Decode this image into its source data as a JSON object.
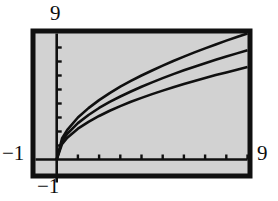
{
  "figure": {
    "kind": "mathematical-plot",
    "background_color": "#ffffff",
    "plot_background_color": "#d2d2d2",
    "frame_color": "#101010",
    "curve_color": "#101010"
  },
  "labels": {
    "top": "9",
    "left": "−1",
    "right": "9",
    "bottom": "−1"
  },
  "chart_data": {
    "type": "line",
    "title": "",
    "xlabel": "",
    "ylabel": "",
    "xlim": [
      -1,
      9
    ],
    "ylim": [
      -1,
      9
    ],
    "grid": false,
    "legend": "none",
    "axis_tick_labels": {
      "x": [
        "-1",
        "9"
      ],
      "y": [
        "-1",
        "9"
      ]
    },
    "x_ticks": [
      0,
      1,
      2,
      3,
      4,
      5,
      6,
      7,
      8,
      9
    ],
    "y_ticks": [
      0,
      1,
      2,
      3,
      4,
      5,
      6,
      7,
      8
    ],
    "x": [
      0,
      0.25,
      0.5,
      1,
      1.5,
      2,
      2.5,
      3,
      3.5,
      4,
      4.5,
      5,
      5.5,
      6,
      6.5,
      7,
      7.5,
      8,
      8.5,
      9
    ],
    "series": [
      {
        "name": "upper",
        "values": [
          0,
          1.5,
          2.12,
          3,
          3.67,
          4.24,
          4.74,
          5.2,
          5.61,
          6,
          6.36,
          6.71,
          7.04,
          7.35,
          7.65,
          7.94,
          8.22,
          8.49,
          8.75,
          9
        ]
      },
      {
        "name": "middle",
        "values": [
          0,
          1.3,
          1.84,
          2.6,
          3.18,
          3.68,
          4.11,
          4.5,
          4.86,
          5.2,
          5.51,
          5.81,
          6.1,
          6.37,
          6.63,
          6.88,
          7.12,
          7.35,
          7.58,
          7.8
        ]
      },
      {
        "name": "lower",
        "values": [
          0,
          1.1,
          1.56,
          2.2,
          2.69,
          3.11,
          3.48,
          3.81,
          4.12,
          4.4,
          4.67,
          4.92,
          5.16,
          5.39,
          5.61,
          5.82,
          6.03,
          6.22,
          6.41,
          6.6
        ]
      }
    ]
  }
}
